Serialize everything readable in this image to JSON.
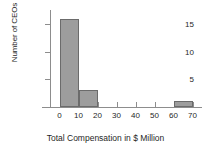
{
  "chart_data": {
    "type": "bar",
    "title": "",
    "xlabel": "Total Compensation in $ Million",
    "ylabel": "Number of CEOs",
    "bin_edges": [
      0,
      10,
      20,
      30,
      40,
      50,
      60,
      70
    ],
    "categories": [
      "0-10",
      "10-20",
      "20-30",
      "30-40",
      "40-50",
      "50-60",
      "60-70"
    ],
    "values": [
      16,
      3,
      0,
      0,
      0,
      0,
      1
    ],
    "xlim": [
      -5,
      75
    ],
    "ylim": [
      0,
      17
    ],
    "x_ticks": [
      "0",
      "10",
      "20",
      "30",
      "40",
      "50",
      "60",
      "70"
    ],
    "x_tick_values": [
      0,
      10,
      20,
      30,
      40,
      50,
      60,
      70
    ],
    "y_ticks": [
      "5",
      "10",
      "15"
    ],
    "y_tick_values": [
      5,
      10,
      15
    ],
    "grid": false,
    "legend": "none",
    "bar_fill_color": "#9d9d9d",
    "bar_edge_color": "#6b6b6b",
    "axis_color": "#8d8d8d",
    "background_color": "#ffffff"
  }
}
